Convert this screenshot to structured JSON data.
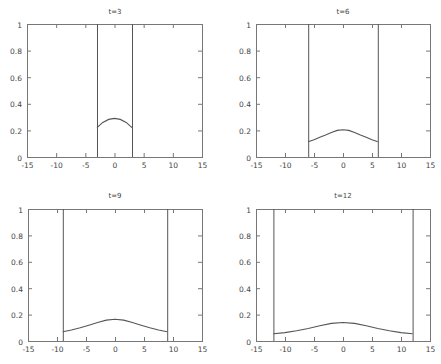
{
  "figure": {
    "background": "#ffffff",
    "axis_color": "#777777",
    "line_color": "#555555",
    "text_color": "#444444"
  },
  "chart_data": [
    {
      "type": "line",
      "title": "t=3",
      "xlabel": "",
      "ylabel": "",
      "xlim": [
        -15,
        15
      ],
      "ylim": [
        0,
        1
      ],
      "xticks": [
        -15,
        -10,
        -5,
        0,
        5,
        10,
        15
      ],
      "yticks": [
        0,
        0.2,
        0.4,
        0.6,
        0.8,
        1
      ],
      "ytick_labels": [
        "0",
        "0.2",
        "0.4",
        "0.6",
        "0.8",
        "1"
      ],
      "grid": false,
      "boundary_lines": [
        -3,
        3
      ],
      "series": [
        {
          "name": "u(x,t)",
          "x": [
            -3,
            -2,
            -1,
            0,
            1,
            2,
            3
          ],
          "y": [
            0.22,
            0.26,
            0.283,
            0.29,
            0.283,
            0.26,
            0.22
          ]
        }
      ],
      "frame": {
        "x0": 27,
        "x1": 202,
        "y0": 24,
        "y1": 157
      },
      "title_pos": {
        "x": 115,
        "y": 10
      }
    },
    {
      "type": "line",
      "title": "t=6",
      "xlabel": "",
      "ylabel": "",
      "xlim": [
        -15,
        15
      ],
      "ylim": [
        0,
        1
      ],
      "xticks": [
        -15,
        -10,
        -5,
        0,
        5,
        10,
        15
      ],
      "yticks": [
        0,
        0.2,
        0.4,
        0.6,
        0.8,
        1
      ],
      "ytick_labels": [
        "0",
        "0.2",
        "0.4",
        "0.6",
        "0.8",
        "1"
      ],
      "grid": false,
      "boundary_lines": [
        -6,
        6
      ],
      "series": [
        {
          "name": "u(x,t)",
          "x": [
            -6,
            -5,
            -4,
            -3,
            -2,
            -1,
            0,
            1,
            2,
            3,
            4,
            5,
            6
          ],
          "y": [
            0.115,
            0.13,
            0.148,
            0.165,
            0.185,
            0.2,
            0.205,
            0.2,
            0.185,
            0.165,
            0.148,
            0.13,
            0.115
          ]
        }
      ],
      "frame": {
        "x0": 256,
        "x1": 430,
        "y0": 24,
        "y1": 157
      },
      "title_pos": {
        "x": 343,
        "y": 10
      }
    },
    {
      "type": "line",
      "title": "t=9",
      "xlabel": "",
      "ylabel": "",
      "xlim": [
        -15,
        15
      ],
      "ylim": [
        0,
        1
      ],
      "xticks": [
        -15,
        -10,
        -5,
        0,
        5,
        10,
        15
      ],
      "yticks": [
        0,
        0.2,
        0.4,
        0.6,
        0.8,
        1
      ],
      "ytick_labels": [
        "0",
        "0.2",
        "0.4",
        "0.6",
        "0.8",
        "1"
      ],
      "grid": false,
      "boundary_lines": [
        -9,
        9
      ],
      "series": [
        {
          "name": "u(x,t)",
          "x": [
            -9,
            -7.5,
            -6,
            -4.5,
            -3,
            -1.5,
            0,
            1.5,
            3,
            4.5,
            6,
            7.5,
            9
          ],
          "y": [
            0.07,
            0.083,
            0.1,
            0.12,
            0.14,
            0.158,
            0.165,
            0.158,
            0.14,
            0.12,
            0.1,
            0.083,
            0.07
          ]
        }
      ],
      "frame": {
        "x0": 28,
        "x1": 202,
        "y0": 209,
        "y1": 341
      },
      "title_pos": {
        "x": 115,
        "y": 194
      }
    },
    {
      "type": "line",
      "title": "t=12",
      "xlabel": "",
      "ylabel": "",
      "xlim": [
        -15,
        15
      ],
      "ylim": [
        0,
        1
      ],
      "xticks": [
        -15,
        -10,
        -5,
        0,
        5,
        10,
        15
      ],
      "yticks": [
        0,
        0.2,
        0.4,
        0.6,
        0.8,
        1
      ],
      "ytick_labels": [
        "0",
        "0.2",
        "0.4",
        "0.6",
        "0.8",
        "1"
      ],
      "grid": false,
      "boundary_lines": [
        -12,
        12
      ],
      "series": [
        {
          "name": "u(x,t)",
          "x": [
            -12,
            -10,
            -8,
            -6,
            -4,
            -2,
            0,
            2,
            4,
            6,
            8,
            10,
            12
          ],
          "y": [
            0.055,
            0.064,
            0.078,
            0.095,
            0.115,
            0.133,
            0.14,
            0.133,
            0.115,
            0.095,
            0.078,
            0.064,
            0.055
          ]
        }
      ],
      "frame": {
        "x0": 256,
        "x1": 430,
        "y0": 209,
        "y1": 341
      },
      "title_pos": {
        "x": 343,
        "y": 194
      }
    }
  ]
}
